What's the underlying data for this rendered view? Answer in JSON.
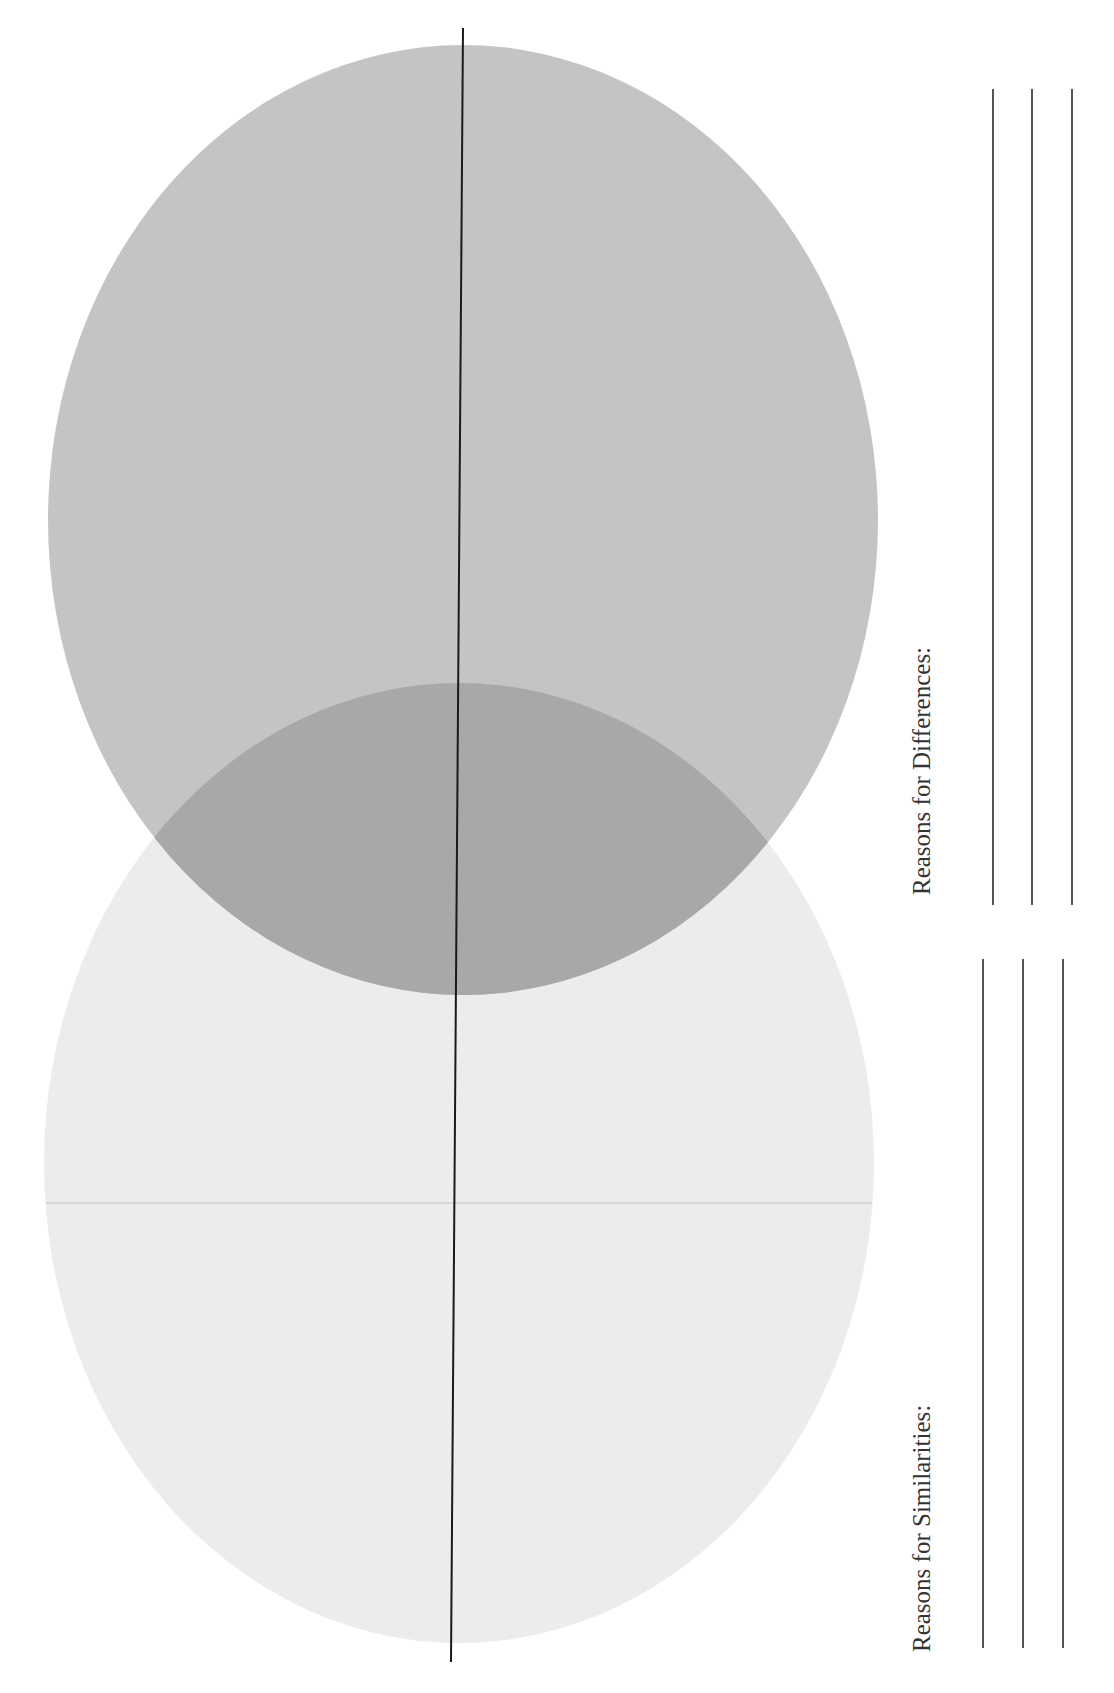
{
  "worksheet": {
    "diagram_type": "venn-diagram-two-circles",
    "orientation": "rotated 90 degrees counter-clockwise",
    "colors": {
      "upper_circle": "#c4c4c4",
      "lower_circle": "#ececec",
      "overlap": "#a8a8a8",
      "divider_line": "#1a1a1a",
      "writing_lines": "#555555",
      "text": "#333333"
    },
    "circles": [
      {
        "name": "upper-circle",
        "cx": 463,
        "cy": 520,
        "rx": 415,
        "ry": 475
      },
      {
        "name": "lower-circle",
        "cx": 459,
        "cy": 1163,
        "rx": 415,
        "ry": 480
      }
    ],
    "sections": {
      "differences": {
        "label": "Reasons for Differences:",
        "line_count": 3
      },
      "similarities": {
        "label": "Reasons for Similarities:",
        "line_count": 3
      }
    }
  }
}
